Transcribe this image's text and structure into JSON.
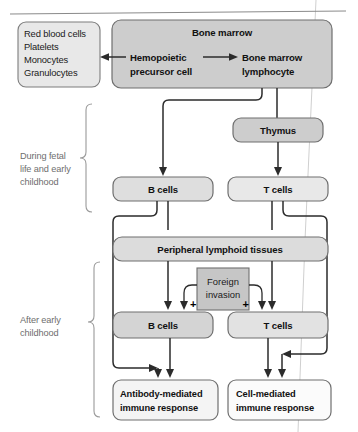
{
  "figure": {
    "top_rule": "horizontal-rule"
  },
  "boxes": {
    "blood_cells": {
      "lines": [
        "Red blood cells",
        "Platelets",
        "Monocytes",
        "Granulocytes"
      ],
      "fill": "#e8e8e8"
    },
    "bone_marrow": {
      "title": "Bone marrow",
      "precursor_line1": "Hemopoietic",
      "precursor_line2": "precursor cell",
      "lymphocyte_line1": "Bone marrow",
      "lymphocyte_line2": "lymphocyte",
      "fill": "#cdcdcd"
    },
    "thymus": {
      "label": "Thymus",
      "fill": "#cdcdcd"
    },
    "b_cells_early": {
      "label": "B cells",
      "fill": "#dedede"
    },
    "t_cells_early": {
      "label": "T cells",
      "fill": "#e8e8e8"
    },
    "peripheral": {
      "label": "Peripheral lymphoid tissues",
      "fill": "#dcdcdc"
    },
    "foreign_invasion": {
      "line1": "Foreign",
      "line2": "invasion",
      "fill": "#c6c6c6"
    },
    "b_cells_late": {
      "label": "B cells",
      "fill": "#d4d4d4"
    },
    "t_cells_late": {
      "label": "T cells",
      "fill": "#e2e2e2"
    },
    "antibody_response": {
      "line1": "Antibody-mediated",
      "line2": "immune response",
      "fill": "#f4f4f4"
    },
    "cell_response": {
      "line1": "Cell-mediated",
      "line2": "immune response",
      "fill": "#fbfbfb"
    }
  },
  "braces": {
    "fetal": {
      "line1": "During fetal",
      "line2": "life and early",
      "line3": "childhood"
    },
    "after": {
      "line1": "After early",
      "line2": "childhood"
    }
  },
  "symbols": {
    "plus_left": "+",
    "plus_right": "+"
  },
  "colors": {
    "stroke": "#2b2b2b",
    "brace_stroke": "#9a9a9a",
    "text": "#111111",
    "muted_text": "#6e6e6e"
  }
}
